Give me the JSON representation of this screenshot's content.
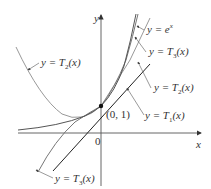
{
  "figure": {
    "axes": {
      "x_label": "x",
      "y_label": "y",
      "origin_label": "0",
      "point_label": "(0, 1)"
    },
    "curves": [
      {
        "id": "exp",
        "label_prefix": "y = ",
        "label_fn": "e",
        "label_sup": "x",
        "label_suffix": "",
        "color": "#555555"
      },
      {
        "id": "T3",
        "label_prefix": "y = ",
        "label_fn": "T",
        "label_sub": "3",
        "label_suffix": "(x)",
        "color": "#777777"
      },
      {
        "id": "T2",
        "label_prefix": "y = ",
        "label_fn": "T",
        "label_sub": "2",
        "label_suffix": "(x)",
        "color": "#999999"
      },
      {
        "id": "T1",
        "label_prefix": "y = ",
        "label_fn": "T",
        "label_sub": "1",
        "label_suffix": "(x)",
        "color": "#222222"
      }
    ],
    "labels": {
      "exp": "y = e",
      "exp_sup": "x",
      "T3_right": "y = T",
      "T3_right_sub": "3",
      "T3_right_suffix": "(x)",
      "T2_right": "y = T",
      "T2_right_sub": "2",
      "T2_right_suffix": "(x)",
      "T1": "y = T",
      "T1_sub": "1",
      "T1_suffix": "(x)",
      "T2_left": "y = T",
      "T2_left_sub": "2",
      "T2_left_suffix": "(x)",
      "T3_bottom": "y = T",
      "T3_bottom_sub": "3",
      "T3_bottom_suffix": "(x)"
    }
  }
}
